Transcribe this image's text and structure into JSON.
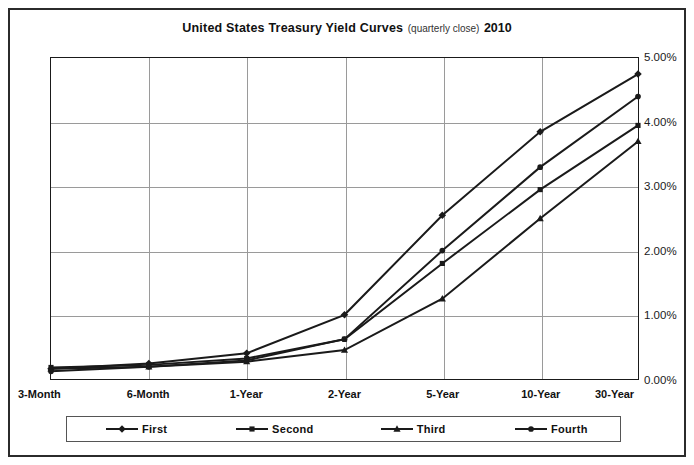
{
  "title": {
    "main": "United States Treasury Yield Curves",
    "sub": "(quarterly close)",
    "year": "2010"
  },
  "colors": {
    "series": "#1a1a1a",
    "grid": "#9a9a9a",
    "axis": "#1a1a1a",
    "frame": "#2b2b2b"
  },
  "yaxis": {
    "labels": [
      "0.00%",
      "1.00%",
      "2.00%",
      "3.00%",
      "4.00%",
      "5.00%"
    ],
    "position": "right"
  },
  "legend": {
    "position": "bottom",
    "items": [
      {
        "label": "First",
        "marker": "diamond"
      },
      {
        "label": "Second",
        "marker": "square"
      },
      {
        "label": "Third",
        "marker": "triangle"
      },
      {
        "label": "Fourth",
        "marker": "circle"
      }
    ]
  },
  "chart_data": {
    "type": "line",
    "title": "United States Treasury Yield Curves (quarterly close) 2010",
    "xlabel": "",
    "ylabel": "",
    "ylim": [
      0,
      5
    ],
    "ytick_step": 1,
    "ytick_format": "percent",
    "grid": true,
    "categories": [
      "3-Month",
      "6-Month",
      "1-Year",
      "2-Year",
      "5-Year",
      "10-Year",
      "30-Year"
    ],
    "series": [
      {
        "name": "First",
        "marker": "diamond",
        "values": [
          0.16,
          0.24,
          0.4,
          1.0,
          2.55,
          3.85,
          4.75
        ]
      },
      {
        "name": "Second",
        "marker": "square",
        "values": [
          0.18,
          0.22,
          0.32,
          0.62,
          1.8,
          2.95,
          3.95
        ]
      },
      {
        "name": "Third",
        "marker": "triangle",
        "values": [
          0.16,
          0.19,
          0.27,
          0.45,
          1.25,
          2.5,
          3.7
        ]
      },
      {
        "name": "Fourth",
        "marker": "circle",
        "values": [
          0.12,
          0.19,
          0.29,
          0.62,
          2.0,
          3.3,
          4.4
        ]
      }
    ]
  }
}
